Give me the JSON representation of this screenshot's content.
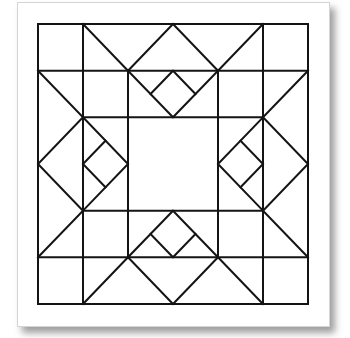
{
  "diagram": {
    "type": "quilt-block",
    "grid": {
      "columns": 6,
      "rows": 6
    },
    "colors": {
      "line": "#141414",
      "background": "#ffffff",
      "card_border": "#d4d4d4",
      "shadow": "#505050"
    },
    "geometry": {
      "x": [
        38,
        83,
        128,
        173,
        218,
        263,
        308
      ],
      "y": [
        24,
        70.7,
        117.3,
        164,
        210.7,
        257.3,
        304
      ]
    }
  }
}
